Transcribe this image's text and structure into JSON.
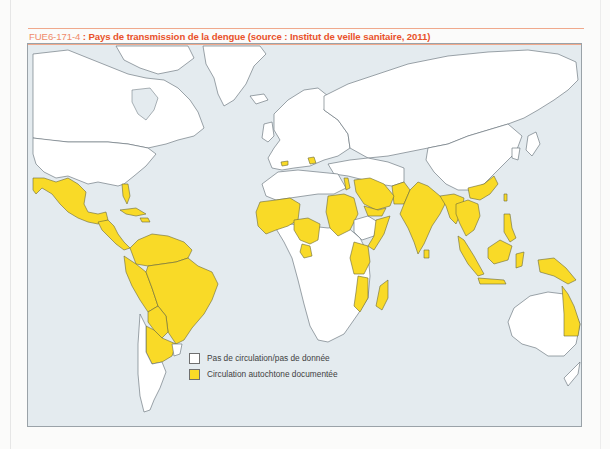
{
  "caption": {
    "code": "FUE6-171-4",
    "separator": " : ",
    "title": "Pays de transmission de la dengue (source : Institut de veille sanitaire, 2011)"
  },
  "colors": {
    "ocean": "#e4ebef",
    "no_data": "#ffffff",
    "transmission": "#f9da27",
    "caption_title": "#e9522a",
    "caption_code": "#f08b6a",
    "frame_border": "#9aa2a8"
  },
  "legend": {
    "items": [
      {
        "label": "Pas de circulation/pas de donnée",
        "color": "#ffffff"
      },
      {
        "label": "Circulation autochtone documentée",
        "color": "#f9da27"
      }
    ]
  },
  "map_regions": [
    {
      "name": "Greenland",
      "status": "none"
    },
    {
      "name": "Canada",
      "status": "none"
    },
    {
      "name": "United States",
      "status": "none"
    },
    {
      "name": "Mexico",
      "status": "transmission"
    },
    {
      "name": "Central America",
      "status": "transmission"
    },
    {
      "name": "Florida",
      "status": "transmission"
    },
    {
      "name": "Caribbean",
      "status": "transmission"
    },
    {
      "name": "Colombia / Venezuela / Guianas",
      "status": "transmission"
    },
    {
      "name": "Ecuador / Peru",
      "status": "transmission"
    },
    {
      "name": "Brazil",
      "status": "transmission"
    },
    {
      "name": "Bolivia / Paraguay",
      "status": "transmission"
    },
    {
      "name": "Northern Argentina",
      "status": "transmission"
    },
    {
      "name": "Southern Argentina / Chile",
      "status": "none"
    },
    {
      "name": "Uruguay",
      "status": "none"
    },
    {
      "name": "Europe",
      "status": "none"
    },
    {
      "name": "Southern France",
      "status": "transmission"
    },
    {
      "name": "Croatia",
      "status": "transmission"
    },
    {
      "name": "Russia / Central Asia",
      "status": "none"
    },
    {
      "name": "North Africa",
      "status": "none"
    },
    {
      "name": "West Africa (Sahel/coast)",
      "status": "transmission"
    },
    {
      "name": "Nigeria / Cameroon",
      "status": "transmission"
    },
    {
      "name": "Gabon",
      "status": "transmission"
    },
    {
      "name": "Sudan",
      "status": "transmission"
    },
    {
      "name": "Egypt (Red Sea coast)",
      "status": "transmission"
    },
    {
      "name": "Saudi Arabia",
      "status": "transmission"
    },
    {
      "name": "Yemen",
      "status": "transmission"
    },
    {
      "name": "Somalia / Djibouti",
      "status": "transmission"
    },
    {
      "name": "Ethiopia",
      "status": "none"
    },
    {
      "name": "Kenya / Tanzania",
      "status": "transmission"
    },
    {
      "name": "Mozambique",
      "status": "transmission"
    },
    {
      "name": "Madagascar",
      "status": "transmission"
    },
    {
      "name": "Southern Africa",
      "status": "none"
    },
    {
      "name": "Central Africa (DRC etc.)",
      "status": "none"
    },
    {
      "name": "Pakistan",
      "status": "transmission"
    },
    {
      "name": "India / Sri Lanka",
      "status": "transmission"
    },
    {
      "name": "Nepal / Bangladesh / Myanmar",
      "status": "transmission"
    },
    {
      "name": "Southern China",
      "status": "transmission"
    },
    {
      "name": "Taiwan",
      "status": "transmission"
    },
    {
      "name": "Indochina",
      "status": "transmission"
    },
    {
      "name": "Philippines",
      "status": "transmission"
    },
    {
      "name": "Malaysia / Indonesia",
      "status": "transmission"
    },
    {
      "name": "Papua New Guinea",
      "status": "transmission"
    },
    {
      "name": "China / Mongolia",
      "status": "none"
    },
    {
      "name": "Japan / Korea",
      "status": "none"
    },
    {
      "name": "Australia",
      "status": "none"
    },
    {
      "name": "Queensland",
      "status": "transmission"
    },
    {
      "name": "New Zealand",
      "status": "none"
    }
  ]
}
